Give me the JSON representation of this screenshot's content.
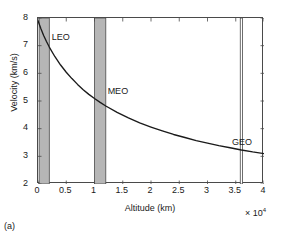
{
  "figure": {
    "caption": "(a)"
  },
  "chart_data": {
    "type": "line",
    "title": "",
    "subtitle": "",
    "xlabel": "Altitude (km)",
    "ylabel": "Velocity (km/s)",
    "x_multiplier": "× 10",
    "x_multiplier_exponent": "4",
    "x_multiplier_value": 10000,
    "xlim": [
      0,
      4
    ],
    "ylim": [
      2,
      8
    ],
    "xticks": [
      "0",
      "0.5",
      "1",
      "1.5",
      "2",
      "2.5",
      "3",
      "3.5",
      "4"
    ],
    "xtick_values": [
      0,
      0.5,
      1,
      1.5,
      2,
      2.5,
      3,
      3.5,
      4
    ],
    "yticks": [
      "2",
      "3",
      "4",
      "5",
      "6",
      "7",
      "8"
    ],
    "ytick_values": [
      2,
      3,
      4,
      5,
      6,
      7,
      8
    ],
    "grid": false,
    "legend": false,
    "legend_position": "none",
    "series": [
      {
        "name": "Orbital velocity",
        "color": "#1a1a1a",
        "x": [
          0,
          0.05,
          0.1,
          0.15,
          0.2,
          0.3,
          0.4,
          0.5,
          0.6,
          0.7,
          0.8,
          0.9,
          1.0,
          1.1,
          1.2,
          1.4,
          1.6,
          1.8,
          2.0,
          2.2,
          2.4,
          2.6,
          2.8,
          3.0,
          3.2,
          3.4,
          3.6,
          3.8,
          4.0
        ],
        "y": [
          7.9,
          7.62,
          7.37,
          7.15,
          6.95,
          6.6,
          6.3,
          6.04,
          5.81,
          5.6,
          5.41,
          5.24,
          5.09,
          4.95,
          4.82,
          4.59,
          4.39,
          4.21,
          4.06,
          3.92,
          3.79,
          3.68,
          3.57,
          3.48,
          3.39,
          3.31,
          3.23,
          3.16,
          3.1
        ]
      }
    ],
    "bands": [
      {
        "label": "LEO",
        "x_start": 0.02,
        "x_end": 0.2,
        "fill": "#b6b6b6",
        "edge": "#4a4a4a",
        "label_x": 0.26,
        "label_y": 7.25
      },
      {
        "label": "MEO",
        "x_start": 1.0,
        "x_end": 1.2,
        "fill": "#b6b6b6",
        "edge": "#4a4a4a",
        "label_x": 1.25,
        "label_y": 5.28
      },
      {
        "label": "GEO",
        "x_start": 3.58,
        "x_end": 3.62,
        "fill": "#ffffff",
        "edge": "#4a4a4a",
        "label_x": 3.45,
        "label_y": 3.45
      }
    ],
    "colors": {
      "curve": "#1a1a1a",
      "band_fill": "#b6b6b6",
      "frame": "#4a4a4a",
      "background": "#ffffff",
      "text": "#1a1a1a"
    }
  }
}
